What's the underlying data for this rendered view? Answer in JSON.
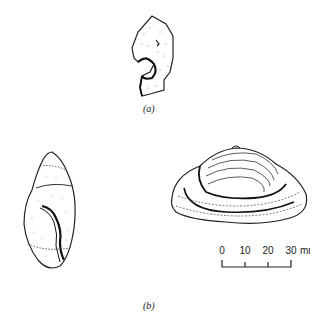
{
  "figure": {
    "panels": [
      {
        "id": "a",
        "label": "(a)",
        "subject": "shell-fragment-drawing"
      },
      {
        "id": "b",
        "label": "(b)",
        "subjects": [
          "gastropod-shell-drawing",
          "bivalve-shell-drawing"
        ]
      }
    ],
    "scale_bar": {
      "ticks": [
        "0",
        "10",
        "20",
        "30"
      ],
      "unit": "mm",
      "last_label": "30 mm"
    }
  }
}
